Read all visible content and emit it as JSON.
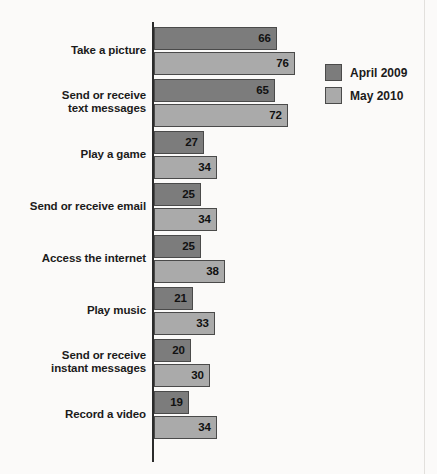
{
  "chart_data": {
    "type": "bar",
    "orientation": "horizontal",
    "title": "",
    "subtitle": "",
    "xlabel": "",
    "ylabel": "",
    "grid": false,
    "legend_position": "right-top",
    "xlim": [
      0,
      80
    ],
    "categories": [
      "Take a picture",
      "Send or receive text messages",
      "Play a game",
      "Send or receive email",
      "Access the internet",
      "Play music",
      "Send or receive instant messages",
      "Record a video"
    ],
    "series": [
      {
        "name": "April 2009",
        "color": "#7c7c7c",
        "values": [
          66,
          65,
          27,
          25,
          25,
          21,
          20,
          19
        ]
      },
      {
        "name": "May 2010",
        "color": "#aaaaaa",
        "values": [
          76,
          72,
          34,
          34,
          38,
          33,
          30,
          34
        ]
      }
    ]
  },
  "categories_display": [
    {
      "line1": "Take a picture",
      "line2": ""
    },
    {
      "line1": "Send or receive",
      "line2": "text messages"
    },
    {
      "line1": "Play a game",
      "line2": ""
    },
    {
      "line1": "Send or receive email",
      "line2": ""
    },
    {
      "line1": "Access the internet",
      "line2": ""
    },
    {
      "line1": "Play music",
      "line2": ""
    },
    {
      "line1": "Send or receive",
      "line2": "instant messages"
    },
    {
      "line1": "Record a video",
      "line2": ""
    }
  ],
  "legend": {
    "items": [
      {
        "label": "April 2009",
        "color": "#7c7c7c"
      },
      {
        "label": "May 2010",
        "color": "#aaaaaa"
      }
    ]
  },
  "colors": {
    "background": "#fbfaf9",
    "axis": "#2b2b2b",
    "bar_border": "#4a4a4a",
    "series_april_2009": "#7c7c7c",
    "series_may_2010": "#aaaaaa",
    "text": "#1b1b1b"
  },
  "layout": {
    "axis_x_px": 152,
    "plot_top_px": 27,
    "group_pitch_px": 52,
    "bar_height_px": 23,
    "px_per_unit": 1.86
  }
}
